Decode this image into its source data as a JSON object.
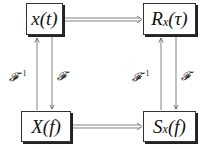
{
  "diagram": {
    "type": "commutative-diagram",
    "nodes": [
      {
        "id": "x_t",
        "label": "x(t)",
        "position": "top-left"
      },
      {
        "id": "R_x_tau",
        "label": "R",
        "sub": "x",
        "rest": "(τ)",
        "position": "top-right"
      },
      {
        "id": "X_f",
        "label": "X(f)",
        "position": "bottom-left"
      },
      {
        "id": "S_x_f",
        "label": "S",
        "sub": "x",
        "rest": "(f)",
        "position": "bottom-right"
      }
    ],
    "edges": [
      {
        "from": "x_t",
        "to": "R_x_tau",
        "style": "double-arrow"
      },
      {
        "from": "X_f",
        "to": "S_x_f",
        "style": "double-arrow"
      },
      {
        "from": "X_f",
        "to": "x_t",
        "label": "𝓕",
        "sup": "−1"
      },
      {
        "from": "x_t",
        "to": "X_f",
        "label": "𝓕"
      },
      {
        "from": "S_x_f",
        "to": "R_x_tau",
        "label": "𝓕",
        "sup": "−1"
      },
      {
        "from": "R_x_tau",
        "to": "S_x_f",
        "label": "𝓕"
      }
    ],
    "labels": {
      "left_inverse": "𝓕",
      "left_inverse_sup": "−1",
      "left_forward": "𝓕",
      "right_inverse": "𝓕",
      "right_inverse_sup": "−1",
      "right_forward": "𝓕"
    }
  }
}
